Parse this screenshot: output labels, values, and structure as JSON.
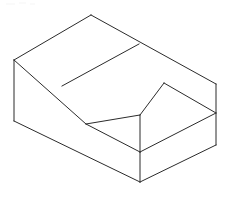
{
  "document": {
    "title": "Isometric Wireframe Drawing",
    "description": "Line drawing of a rectangular block with a rectangular step notch cut from the front-right region, drawn in isometric projection.",
    "background_color": "#ffffff",
    "line_color": "#2b2b2b",
    "line_width": 1,
    "canvas": {
      "width": 232,
      "height": 198
    }
  },
  "drawing": {
    "type": "isometric-wireframe",
    "projection": "isometric",
    "fill": "none",
    "vertices": {
      "top_rear": [
        91,
        15
      ],
      "top_left": [
        14,
        60
      ],
      "top_right": [
        216,
        84
      ],
      "top_front": [
        140,
        115
      ],
      "notch_top": [
        164,
        83
      ],
      "notch_left": [
        86,
        124
      ],
      "notch_front": [
        140,
        152
      ],
      "left_bottom": [
        14,
        121
      ],
      "right_bottom": [
        216,
        145
      ],
      "bottom_front": [
        140,
        182
      ],
      "mid_top_edge": [
        139,
        44
      ],
      "mid_left_edge": [
        62,
        86
      ]
    },
    "paths": [
      {
        "name": "top-face-outline",
        "points": "91,15 216,84 140,115 86,124 14,60",
        "closed": true
      },
      {
        "name": "step-notch-face",
        "points": "164,83 216,113 140,152 86,124 140,115",
        "closed": false
      },
      {
        "name": "left-vertical-edge",
        "points": "14,60 14,121"
      },
      {
        "name": "right-vertical-edge",
        "points": "216,84 216,145"
      },
      {
        "name": "front-vertical-edge",
        "points": "140,152 140,182"
      },
      {
        "name": "notch-vertical-edge",
        "points": "140,115 140,152"
      },
      {
        "name": "bottom-left-edge",
        "points": "14,121 140,182"
      },
      {
        "name": "bottom-right-edge",
        "points": "140,182 216,145"
      },
      {
        "name": "notch-inner-left-edge",
        "points": "86,124 140,152"
      },
      {
        "name": "notch-inner-right-edge",
        "points": "164,83 216,113"
      },
      {
        "name": "top-face-crease",
        "points": "139,44 62,86"
      },
      {
        "name": "notch-top-ridge",
        "points": "140,115 164,83"
      },
      {
        "name": "step-lower-edge",
        "points": "140,152 216,113"
      },
      {
        "name": "notch-left-ridge",
        "points": "86,124 140,115"
      }
    ],
    "labels": []
  }
}
